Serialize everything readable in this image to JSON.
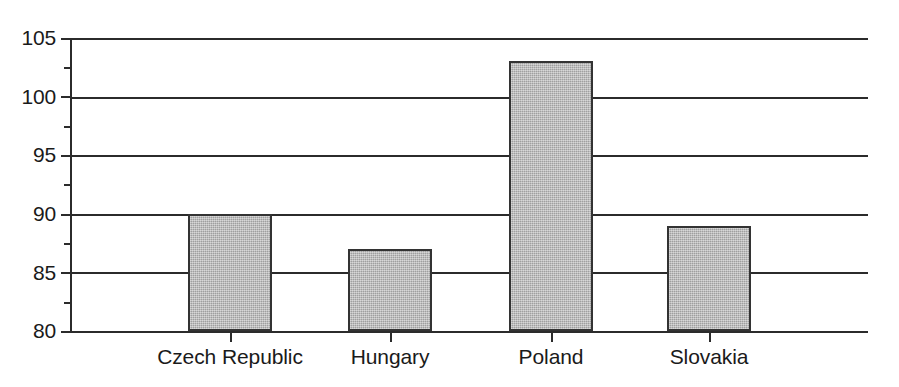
{
  "chart_data": {
    "type": "bar",
    "title": "",
    "subtitle": "",
    "xlabel": "",
    "ylabel": "",
    "categories": [
      "Czech Republic",
      "Hungary",
      "Poland",
      "Slovakia"
    ],
    "values": [
      90,
      87,
      103,
      89
    ],
    "ylim": [
      80,
      105
    ],
    "ytick_labels": [
      "105",
      "100",
      "95",
      "90",
      "85",
      "80"
    ],
    "ytick_values": [
      105,
      100,
      95,
      90,
      85,
      80
    ],
    "minor_tick_values": [
      102.5,
      97.5,
      92.5,
      87.5,
      82.5
    ],
    "grid": "horizontal",
    "legend": "none",
    "bar_fill_color": "#b2b2b2",
    "bar_edge_color": "#333333",
    "axis_color": "#2b2b2b"
  }
}
